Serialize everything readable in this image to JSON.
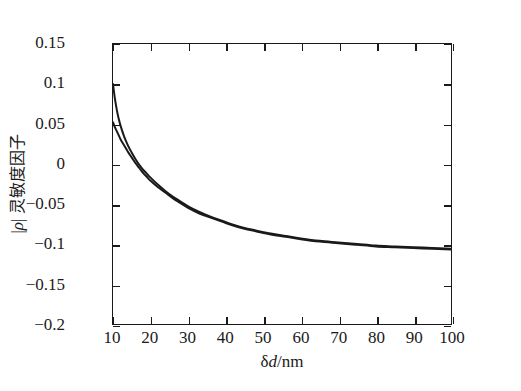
{
  "chart_data": {
    "type": "line",
    "title": "",
    "subtitle": "",
    "xlabel": "δd/nm",
    "xlabel_symbol": "δ",
    "xlabel_italic": "d",
    "xlabel_unit": "/nm",
    "ylabel": "|ρ| 灵敏度因子",
    "ylabel_symbol": "ρ",
    "ylabel_cjk": "灵敏度因子",
    "xlim": [
      10,
      100
    ],
    "ylim": [
      -0.2,
      0.15
    ],
    "xticks": [
      10,
      20,
      30,
      40,
      50,
      60,
      70,
      80,
      90,
      100
    ],
    "xticklabels": [
      "10",
      "20",
      "30",
      "40",
      "50",
      "60",
      "70",
      "80",
      "90",
      "100"
    ],
    "yticks": [
      -0.2,
      -0.15,
      -0.1,
      -0.05,
      0,
      0.05,
      0.1,
      0.15
    ],
    "yticklabels": [
      "-0.2",
      "-0.15",
      "-0.1",
      "-0.05",
      "0",
      "0.05",
      "0.1",
      "0.15"
    ],
    "grid": false,
    "legend": false,
    "legend_position": "none",
    "frame": true,
    "tick_direction": "in",
    "line_color": "#1a1a1a",
    "background_color": "#ffffff",
    "series": [
      {
        "name": "curve-upper",
        "color": "#1a1a1a",
        "x": [
          10,
          10.5,
          11,
          11.5,
          12,
          13,
          14,
          15,
          16,
          17,
          18,
          19,
          20,
          22,
          24,
          26,
          28,
          30,
          33,
          36,
          39,
          42,
          45,
          48,
          52,
          56,
          60,
          65,
          70,
          75,
          80,
          85,
          90,
          95,
          100
        ],
        "values": [
          0.1,
          0.082,
          0.068,
          0.057,
          0.048,
          0.034,
          0.023,
          0.014,
          0.006,
          -0.001,
          -0.007,
          -0.012,
          -0.017,
          -0.026,
          -0.034,
          -0.041,
          -0.047,
          -0.053,
          -0.06,
          -0.066,
          -0.071,
          -0.076,
          -0.08,
          -0.083,
          -0.087,
          -0.09,
          -0.093,
          -0.096,
          -0.098,
          -0.1,
          -0.102,
          -0.103,
          -0.104,
          -0.105,
          -0.106
        ]
      },
      {
        "name": "curve-lower",
        "color": "#1a1a1a",
        "x": [
          10,
          10.5,
          11,
          11.5,
          12,
          13,
          14,
          15,
          16,
          17,
          18,
          19,
          20,
          22,
          24,
          26,
          28,
          30,
          33,
          36,
          39,
          42,
          45,
          48,
          52,
          56,
          60,
          65,
          70,
          75,
          80,
          85,
          90,
          95,
          100
        ],
        "values": [
          0.052,
          0.046,
          0.041,
          0.036,
          0.031,
          0.023,
          0.015,
          0.008,
          0.001,
          -0.005,
          -0.011,
          -0.016,
          -0.021,
          -0.029,
          -0.036,
          -0.043,
          -0.049,
          -0.055,
          -0.062,
          -0.067,
          -0.072,
          -0.077,
          -0.081,
          -0.084,
          -0.088,
          -0.091,
          -0.094,
          -0.097,
          -0.099,
          -0.101,
          -0.103,
          -0.104,
          -0.105,
          -0.106,
          -0.107
        ]
      }
    ]
  }
}
